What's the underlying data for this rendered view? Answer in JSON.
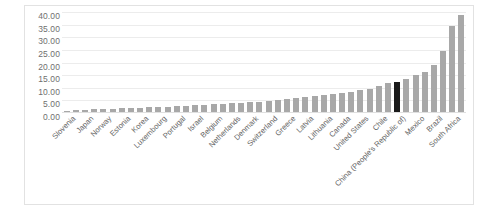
{
  "chart_data": {
    "type": "bar",
    "title": "",
    "subtitle": "",
    "xlabel": "",
    "ylabel": "",
    "ylim": [
      0,
      40
    ],
    "ytick_labels": [
      "40.00",
      "35.00",
      "30.00",
      "25.00",
      "20.00",
      "15.00",
      "10.00",
      "5.00",
      "0.00"
    ],
    "ytick_values": [
      40,
      35,
      30,
      25,
      20,
      15,
      10,
      5,
      0
    ],
    "grid": true,
    "legend": false,
    "bar_color": "#a8a8a8",
    "highlight_color": "#1a1a1a",
    "highlight_category": "China (People's Republic of)",
    "label_every_nth": 2,
    "categories": [
      "Slovenia",
      "Slovak Republic",
      "Japan",
      "Finland",
      "Norway",
      "Iceland",
      "Estonia",
      "Hungary",
      "Korea",
      "Austria",
      "Luxembourg",
      "Sweden",
      "Portugal",
      "Ireland",
      "Israel",
      "Czech Republic",
      "Belgium",
      "Spain",
      "Netherlands",
      "Germany",
      "Denmark",
      "France",
      "Switzerland",
      "Italy",
      "Greece",
      "Poland",
      "Latvia",
      "New Zealand",
      "Lithuania",
      "Australia",
      "Canada",
      "Turkey",
      "United States",
      "Indonesia",
      "Chile",
      "India",
      "China (People's Republic of)",
      "Colombia",
      "Mexico",
      "Russia",
      "Brazil",
      "Argentina",
      "South Africa",
      "Costa Rica"
    ],
    "values": [
      0.6,
      0.7,
      0.9,
      1.0,
      1.1,
      1.2,
      1.4,
      1.5,
      1.7,
      1.8,
      2.0,
      2.1,
      2.3,
      2.4,
      2.6,
      2.8,
      3.0,
      3.2,
      3.4,
      3.6,
      3.9,
      4.1,
      4.4,
      4.7,
      5.0,
      5.4,
      5.8,
      6.2,
      6.6,
      7.0,
      7.5,
      8.0,
      8.6,
      9.3,
      10.2,
      11.5,
      11.8,
      13.0,
      14.5,
      16.0,
      18.5,
      24.0,
      34.0,
      38.5
    ]
  }
}
